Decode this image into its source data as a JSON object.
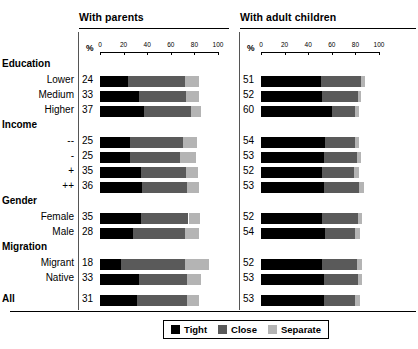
{
  "panels": [
    {
      "key": "with_parents",
      "title": "With parents"
    },
    {
      "key": "with_adult_children",
      "title": "With adult children"
    }
  ],
  "axis": {
    "unit_label": "%",
    "ticks": [
      "0",
      "20",
      "40",
      "60",
      "80",
      "100"
    ],
    "min": 0,
    "max": 100
  },
  "legend": {
    "items": [
      {
        "label": "Tight",
        "color": "#000000"
      },
      {
        "label": "Close",
        "color": "#5a5a5a"
      },
      {
        "label": "Separate",
        "color": "#b4b4b4"
      }
    ]
  },
  "groups": [
    {
      "name": "Education",
      "rows": [
        "Lower",
        "Medium",
        "Higher"
      ]
    },
    {
      "name": "Income",
      "rows": [
        "--",
        "-",
        "+",
        "++"
      ]
    },
    {
      "name": "Gender",
      "rows": [
        "Female",
        "Male"
      ]
    },
    {
      "name": "Migration",
      "rows": [
        "Migrant",
        "Native"
      ]
    },
    {
      "name": "All",
      "rows": []
    }
  ],
  "chart_data": {
    "type": "bar",
    "orientation": "horizontal",
    "stacked": true,
    "title": "",
    "xlabel": "%",
    "ylabel": "",
    "xlim": [
      0,
      100
    ],
    "grid": false,
    "legend_position": "bottom",
    "series": [
      {
        "name": "Tight",
        "color": "#000000"
      },
      {
        "name": "Close",
        "color": "#5a5a5a"
      },
      {
        "name": "Separate",
        "color": "#b4b4b4"
      }
    ],
    "panels": [
      {
        "title": "With parents",
        "categories": [
          "Lower",
          "Medium",
          "Higher",
          "--",
          "-",
          "+",
          "++",
          "Female",
          "Male",
          "Migrant",
          "Native",
          "All"
        ],
        "groups": [
          "Education",
          "Education",
          "Education",
          "Income",
          "Income",
          "Income",
          "Income",
          "Gender",
          "Gender",
          "Migration",
          "Migration",
          "All"
        ],
        "tight": [
          24,
          33,
          37,
          25,
          25,
          35,
          36,
          35,
          28,
          18,
          33,
          31
        ],
        "close": [
          48,
          40,
          40,
          45,
          43,
          38,
          38,
          40,
          44,
          54,
          41,
          43
        ],
        "separate": [
          12,
          11,
          9,
          12,
          13,
          10,
          10,
          10,
          12,
          20,
          12,
          10
        ]
      },
      {
        "title": "With adult children",
        "categories": [
          "Lower",
          "Medium",
          "Higher",
          "--",
          "-",
          "+",
          "++",
          "Female",
          "Male",
          "Migrant",
          "Native",
          "All"
        ],
        "groups": [
          "Education",
          "Education",
          "Education",
          "Income",
          "Income",
          "Income",
          "Income",
          "Gender",
          "Gender",
          "Migration",
          "Migration",
          "All"
        ],
        "tight": [
          51,
          52,
          60,
          54,
          53,
          52,
          53,
          52,
          54,
          52,
          53,
          53
        ],
        "close": [
          34,
          30,
          20,
          26,
          28,
          27,
          30,
          30,
          26,
          29,
          29,
          27
        ],
        "separate": [
          3,
          3,
          3,
          3,
          4,
          4,
          4,
          4,
          4,
          5,
          4,
          4
        ]
      }
    ]
  },
  "rows": [
    {
      "label": "Education",
      "type": "group",
      "y": 58
    },
    {
      "label": "Lower",
      "type": "row",
      "y": 74,
      "left": {
        "value": "24",
        "tight": 24,
        "close": 48,
        "separate": 12
      },
      "right": {
        "value": "51",
        "tight": 51,
        "close": 34,
        "separate": 3
      }
    },
    {
      "label": "Medium",
      "type": "row",
      "y": 89,
      "left": {
        "value": "33",
        "tight": 33,
        "close": 40,
        "separate": 11
      },
      "right": {
        "value": "52",
        "tight": 52,
        "close": 30,
        "separate": 3
      }
    },
    {
      "label": "Higher",
      "type": "row",
      "y": 104,
      "left": {
        "value": "37",
        "tight": 37,
        "close": 40,
        "separate": 9
      },
      "right": {
        "value": "60",
        "tight": 60,
        "close": 20,
        "separate": 3
      }
    },
    {
      "label": "Income",
      "type": "group",
      "y": 119
    },
    {
      "label": "--",
      "type": "row",
      "y": 135,
      "left": {
        "value": "25",
        "tight": 25,
        "close": 45,
        "separate": 12
      },
      "right": {
        "value": "54",
        "tight": 54,
        "close": 26,
        "separate": 3
      }
    },
    {
      "label": "-",
      "type": "row",
      "y": 150,
      "left": {
        "value": "25",
        "tight": 25,
        "close": 43,
        "separate": 13
      },
      "right": {
        "value": "53",
        "tight": 53,
        "close": 28,
        "separate": 4
      }
    },
    {
      "label": "+",
      "type": "row",
      "y": 165,
      "left": {
        "value": "35",
        "tight": 35,
        "close": 38,
        "separate": 10
      },
      "right": {
        "value": "52",
        "tight": 52,
        "close": 27,
        "separate": 4
      }
    },
    {
      "label": "++",
      "type": "row",
      "y": 180,
      "left": {
        "value": "36",
        "tight": 36,
        "close": 38,
        "separate": 10
      },
      "right": {
        "value": "53",
        "tight": 53,
        "close": 30,
        "separate": 4
      }
    },
    {
      "label": "Gender",
      "type": "group",
      "y": 195
    },
    {
      "label": "Female",
      "type": "row",
      "y": 211,
      "left": {
        "value": "35",
        "tight": 35,
        "close": 40,
        "separate": 10
      },
      "right": {
        "value": "52",
        "tight": 52,
        "close": 30,
        "separate": 4
      }
    },
    {
      "label": "Male",
      "type": "row",
      "y": 226,
      "left": {
        "value": "28",
        "tight": 28,
        "close": 44,
        "separate": 12
      },
      "right": {
        "value": "54",
        "tight": 54,
        "close": 26,
        "separate": 4
      }
    },
    {
      "label": "Migration",
      "type": "group",
      "y": 241
    },
    {
      "label": "Migrant",
      "type": "row",
      "y": 257,
      "left": {
        "value": "18",
        "tight": 18,
        "close": 54,
        "separate": 20
      },
      "right": {
        "value": "52",
        "tight": 52,
        "close": 29,
        "separate": 5
      }
    },
    {
      "label": "Native",
      "type": "row",
      "y": 272,
      "left": {
        "value": "33",
        "tight": 33,
        "close": 41,
        "separate": 12
      },
      "right": {
        "value": "53",
        "tight": 53,
        "close": 29,
        "separate": 4
      }
    },
    {
      "label": "All",
      "type": "row-bold",
      "y": 293,
      "left": {
        "value": "31",
        "tight": 31,
        "close": 43,
        "separate": 10
      },
      "right": {
        "value": "53",
        "tight": 53,
        "close": 27,
        "separate": 4
      }
    }
  ]
}
